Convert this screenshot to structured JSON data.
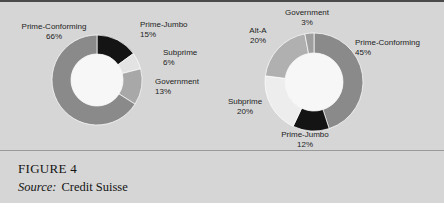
{
  "figure": {
    "title": "FIGURE 4",
    "source_label": "Source:",
    "source_value": "Credit Suisse"
  },
  "colors": {
    "panel_background": "#d6d6d6",
    "top_rule": "#4a4a4a",
    "caption_rule": "#9a9a9a",
    "text": "#1d1d1d",
    "donut_hole": "#f7f7f7",
    "prime_conforming": "#8a8a8a",
    "prime_jumbo": "#141414",
    "subprime_left": "#e3e3e3",
    "government_left": "#a8a8a8",
    "prime_conforming_right": "#8a8a8a",
    "prime_jumbo_right": "#141414",
    "subprime_right": "#ededed",
    "alt_a_right": "#b0b0b0",
    "government_right": "#9e9e9e"
  },
  "chart_data": [
    {
      "type": "pie",
      "variant": "donut",
      "id": "left-donut",
      "title": "",
      "categories": [
        "Prime-Jumbo",
        "Subprime",
        "Government",
        "Prime-Conforming"
      ],
      "values": [
        15,
        6,
        13,
        66
      ],
      "unit": "%",
      "start_angle": 0,
      "direction": "clockwise",
      "legend": "none",
      "labels": [
        {
          "name": "Prime-Jumbo",
          "pct": "15%"
        },
        {
          "name": "Subprime",
          "pct": "6%"
        },
        {
          "name": "Government",
          "pct": "13%"
        },
        {
          "name": "Prime-Conforming",
          "pct": "66%"
        }
      ]
    },
    {
      "type": "pie",
      "variant": "donut",
      "id": "right-donut",
      "title": "",
      "categories": [
        "Prime-Conforming",
        "Prime-Jumbo",
        "Subprime",
        "Alt-A",
        "Government"
      ],
      "values": [
        45,
        12,
        20,
        20,
        3
      ],
      "unit": "%",
      "start_angle": 0,
      "direction": "clockwise",
      "legend": "none",
      "labels": [
        {
          "name": "Prime-Conforming",
          "pct": "45%"
        },
        {
          "name": "Prime-Jumbo",
          "pct": "12%"
        },
        {
          "name": "Subprime",
          "pct": "20%"
        },
        {
          "name": "Alt-A",
          "pct": "20%"
        },
        {
          "name": "Government",
          "pct": "3%"
        }
      ]
    }
  ]
}
